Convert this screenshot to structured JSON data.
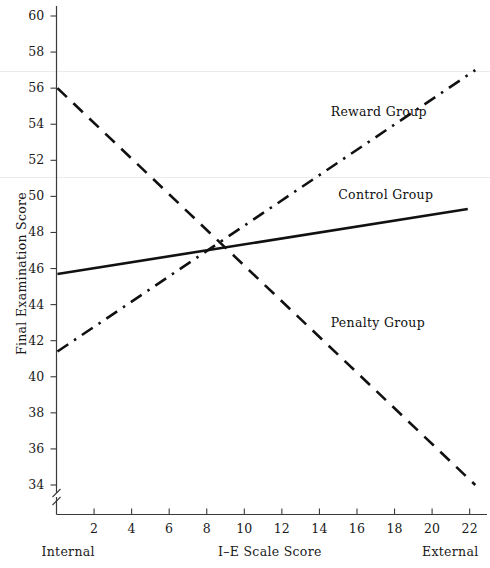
{
  "chart_data": {
    "type": "line",
    "title": "",
    "xlabel": "I–E Scale Score",
    "ylabel": "Final Examination Score",
    "xlim": [
      0,
      23.5
    ],
    "ylim": [
      33,
      60.6
    ],
    "grid": false,
    "legend_position": "inline-annotations",
    "x_axis_left_caption": "Internal",
    "x_axis_right_caption": "External",
    "y_axis_break": true,
    "xticks": [
      2,
      4,
      6,
      8,
      10,
      12,
      14,
      16,
      18,
      20,
      22
    ],
    "xtick_labels": [
      "2",
      "4",
      "6",
      "8",
      "10",
      "12",
      "14",
      "16",
      "18",
      "20",
      "22"
    ],
    "yticks": [
      34,
      36,
      38,
      40,
      42,
      44,
      46,
      48,
      50,
      52,
      54,
      56,
      58,
      60
    ],
    "ytick_labels": [
      "34",
      "36",
      "38",
      "40",
      "42",
      "44",
      "46",
      "48",
      "50",
      "52",
      "54",
      "56",
      "58",
      "60"
    ],
    "series": [
      {
        "name": "Reward Group",
        "style": "dash-dot",
        "color": "#111111",
        "x": [
          0.05,
          22.3
        ],
        "values": [
          41.4,
          57.0
        ],
        "label_x": 14.6,
        "label_y": 54.7
      },
      {
        "name": "Control Group",
        "style": "solid",
        "color": "#111111",
        "x": [
          0.05,
          21.9
        ],
        "values": [
          45.7,
          49.3
        ],
        "label_x": 15.0,
        "label_y": 50.1
      },
      {
        "name": "Penalty Group",
        "style": "dashed",
        "color": "#111111",
        "x": [
          0.05,
          22.3
        ],
        "values": [
          56.0,
          34.0
        ],
        "label_x": 14.6,
        "label_y": 43.0
      }
    ],
    "intersection": {
      "x": 8.7,
      "y": 47.2
    }
  }
}
